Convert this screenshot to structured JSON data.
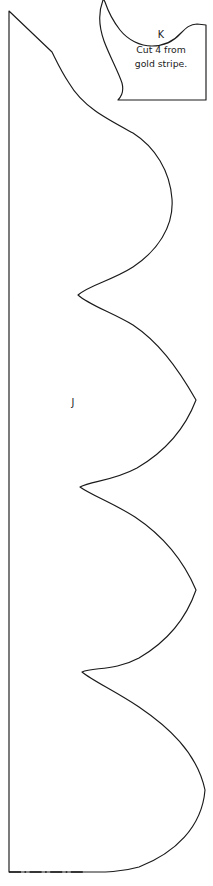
{
  "sheet": {
    "title": "Quilt Pattern Template Sheet",
    "background_color": "#ffffff",
    "ink_color": "#1a1a1a",
    "width": 213,
    "height": 886
  },
  "pieces": [
    {
      "id": "piece-j",
      "label": "J",
      "label_x": 73,
      "label_y": 403,
      "description": "Large scalloped border pattern piece with straight left edge on fold and four scallop bumps along the right edge",
      "instructions": [],
      "outline_path": "M 9,11 L 52,52 C 58,62 62,72 70,84 C 84,108 108,120 134,134 C 156,148 170,172 172,200 C 174,228 158,252 134,268 C 112,282 90,286 79,296 C 90,306 112,313 134,326 C 158,342 176,366 196,400 C 184,434 162,454 138,468 C 114,481 92,482 81,488 C 92,496 114,504 136,518 C 160,534 182,558 196,590 C 186,622 164,644 140,658 C 116,671 94,668 83,673 C 94,682 116,692 140,708 C 168,727 196,752 205,790 C 203,826 176,852 140,866 C 116,872 100,872 86,872 L 86,872",
      "fold_edge": {
        "style": "dash-dot",
        "x1": 9,
        "y1": 872,
        "x2": 86,
        "y2": 872
      },
      "left_edge": {
        "style": "solid",
        "x1": 9,
        "y1": 11,
        "x2": 9,
        "y2": 872
      }
    },
    {
      "id": "piece-k",
      "label": "K",
      "label_x": 161,
      "label_y": 35,
      "description": "Small pattern piece with curved left edge, notched top right, vertical right edge and flat bottom",
      "instructions": [
        "Cut 4 from",
        "gold stripe."
      ],
      "instruction_lines_y": [
        50,
        64
      ],
      "outline_path": "M 119,100 L 206,100 L 206,25 L 198,24 C 190,24 186,28 181,33 C 172,42 162,46 152,46 C 140,46 128,40 120,30 C 112,20 107,10 104,2 L 104,0 L 100,0 C 98,12 99,26 104,40 C 110,56 118,70 122,82 C 124,90 122,96 119,100 Z"
    }
  ],
  "legend": {
    "fold_line_meaning": "place on fold",
    "solid_line_meaning": "cutting line"
  }
}
